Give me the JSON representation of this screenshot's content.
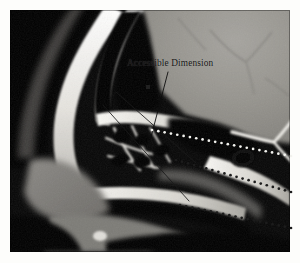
{
  "figure": {
    "domain": "medical-ct-sagittal",
    "modality_label": "",
    "panel": {
      "x": 10,
      "y": 10,
      "width": 280,
      "height": 242,
      "border_color": "#d8d8d4",
      "background_color": "#0a0a0a"
    },
    "page_background": "#fdfdfb"
  },
  "annotations": {
    "labels": [
      {
        "id": "accessible-dimension",
        "text": "Accessible Dimension",
        "x": 127,
        "y": 57,
        "color": "#141414",
        "font_size": 9.3
      }
    ],
    "leader_line": {
      "color": "#0d0d0d",
      "width": 0.9,
      "from_x": 168,
      "from_y": 72,
      "to_x": 150,
      "to_y": 141
    },
    "measurement_lines": [
      {
        "id": "measure-upper",
        "color": "#1a1a1a",
        "width": 0.85,
        "x1": 116,
        "y1": 92,
        "x2": 196,
        "y2": 163
      },
      {
        "id": "measure-lower",
        "color": "#1a1a1a",
        "width": 0.85,
        "x1": 103,
        "y1": 105,
        "x2": 189,
        "y2": 201
      }
    ],
    "dotted_trajectories": [
      {
        "id": "trajectory-upper",
        "dot_color": "#f2f2ee",
        "dot_radius": 1.35,
        "spacing": 6.2,
        "x1": 152,
        "y1": 130,
        "x2": 291,
        "y2": 156
      },
      {
        "id": "trajectory-middle",
        "dot_color": "#1c1c1c",
        "dot_radius": 1.35,
        "spacing": 6.2,
        "x1": 176,
        "y1": 160,
        "x2": 291,
        "y2": 192
      },
      {
        "id": "trajectory-lower",
        "dot_color": "#1c1c1c",
        "dot_radius": 1.35,
        "spacing": 6.2,
        "x1": 180,
        "y1": 205,
        "x2": 291,
        "y2": 228
      }
    ],
    "artifact_mark": {
      "id": "artifact-speck",
      "x": 146,
      "y": 85,
      "width": 4,
      "height": 4,
      "color": "#2a2a2a"
    }
  },
  "colors": {
    "bone_bright": "#f4f3ef",
    "bone_mid": "#c9c7c1",
    "soft_tissue": "#8d8b87",
    "brain_gray": "#9a9893",
    "air_black": "#080808",
    "deep_black": "#000000"
  }
}
